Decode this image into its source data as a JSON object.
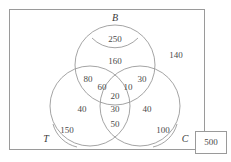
{
  "diagram": {
    "type": "venn-3-set",
    "set_labels": [
      {
        "id": "B",
        "text": "B"
      },
      {
        "id": "T",
        "text": "T"
      },
      {
        "id": "C",
        "text": "C"
      }
    ],
    "regions": [
      {
        "id": "b-only-inner",
        "label": "250",
        "description": "inner cap of set B only"
      },
      {
        "id": "b-only-outer",
        "label": "160",
        "description": "set B only, outside inner cap"
      },
      {
        "id": "b-t-only",
        "label": "80",
        "description": "B and T only, outer part"
      },
      {
        "id": "b-t-only-inner",
        "label": "60",
        "description": "B and T only, inner part"
      },
      {
        "id": "b-t-c-center",
        "label": "20",
        "description": "B and T and C, center"
      },
      {
        "id": "b-c-only-inner",
        "label": "10",
        "description": "B and C only, inner part"
      },
      {
        "id": "b-c-only",
        "label": "30",
        "description": "B and C only, outer part"
      },
      {
        "id": "t-only-outer",
        "label": "40",
        "description": "set T only, outside inner cap"
      },
      {
        "id": "t-only-inner",
        "label": "150",
        "description": "inner cap of set T only"
      },
      {
        "id": "t-c-only-upper",
        "label": "30",
        "description": "T and C only, upper part"
      },
      {
        "id": "t-c-only-lower",
        "label": "50",
        "description": "T and C only, lower part"
      },
      {
        "id": "c-only-outer",
        "label": "40",
        "description": "set C only, outside inner cap"
      },
      {
        "id": "c-only-inner",
        "label": "100",
        "description": "inner cap of set C only"
      },
      {
        "id": "outside-all",
        "label": "140",
        "description": "inside universe, outside all three sets"
      }
    ],
    "universe": {
      "label": "500"
    }
  }
}
